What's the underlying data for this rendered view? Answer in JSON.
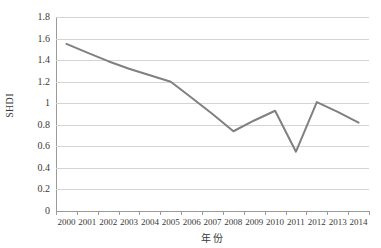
{
  "chart_data": {
    "type": "line",
    "title": "",
    "xlabel": "年份",
    "ylabel": "SHDI",
    "categories": [
      "2000",
      "2001",
      "2002",
      "2003",
      "2004",
      "2005",
      "2006",
      "2007",
      "2008",
      "2009",
      "2010",
      "2011",
      "2012",
      "2013",
      "2014"
    ],
    "series": [
      {
        "name": "SHDI",
        "color": "#808080",
        "values": [
          1.55,
          1.47,
          1.39,
          1.32,
          1.26,
          1.2,
          1.05,
          0.9,
          0.74,
          0.84,
          0.93,
          0.55,
          1.01,
          0.92,
          0.82
        ]
      }
    ],
    "ylim": [
      0,
      1.8
    ],
    "y_ticks": [
      "0",
      "0.2",
      "0.4",
      "0.6",
      "0.8",
      "1",
      "1.2",
      "1.4",
      "1.6",
      "1.8"
    ],
    "y_tick_values": [
      0,
      0.2,
      0.4,
      0.6,
      0.8,
      1,
      1.2,
      1.4,
      1.6,
      1.8
    ],
    "grid": true,
    "legend": "none",
    "gridline_color": "#d4d4d4",
    "axis_color": "#9a9a9a",
    "background": "#ffffff"
  }
}
